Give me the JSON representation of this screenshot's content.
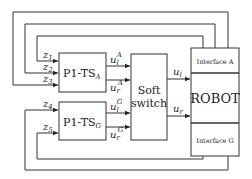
{
  "diagram": {
    "blocks": {
      "p1_ts_a": {
        "main": "P1-TS",
        "sub": "A"
      },
      "p1_ts_g": {
        "main": "P1-TS",
        "sub": "G"
      },
      "soft_switch": {
        "line1": "Soft",
        "line2": "switch"
      },
      "robot": {
        "label": "ROBOT",
        "interface_a": "Interface A",
        "interface_g": "Interface G"
      }
    },
    "signals": {
      "z1": {
        "base": "z",
        "sub": "1"
      },
      "z2": {
        "base": "z",
        "sub": "2"
      },
      "z3": {
        "base": "z",
        "sub": "3"
      },
      "z4": {
        "base": "z",
        "sub": "4"
      },
      "z5": {
        "base": "z",
        "sub": "5"
      },
      "ul_a": {
        "base": "u",
        "sub": "l",
        "sup": "A"
      },
      "ur_a": {
        "base": "u",
        "sub": "r",
        "sup": "A"
      },
      "ul_g": {
        "base": "u",
        "sub": "l",
        "sup": "G"
      },
      "ur_g": {
        "base": "u",
        "sub": "r",
        "sup": "G"
      },
      "ul": {
        "base": "u",
        "sub": "l"
      },
      "ur": {
        "base": "u",
        "sub": "r"
      }
    }
  }
}
